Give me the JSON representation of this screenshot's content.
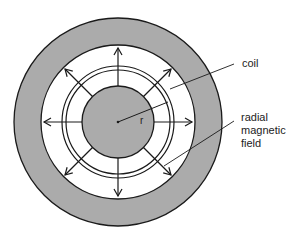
{
  "diagram": {
    "labels": {
      "coil": "coil",
      "field_line1": "radial",
      "field_line2": "magnetic",
      "field_line3": "field",
      "radius": "r"
    },
    "colors": {
      "grey_fill": "#ababab",
      "stroke": "#1a1a1a",
      "background": "#ffffff"
    },
    "geometry": {
      "center": [
        118,
        122
      ],
      "outer_radius": 104,
      "inner_pole_radius": 77,
      "core_radius": 36,
      "coil_outer_radius": 56,
      "coil_inner_radius": 52,
      "arrow_count": 8
    }
  }
}
